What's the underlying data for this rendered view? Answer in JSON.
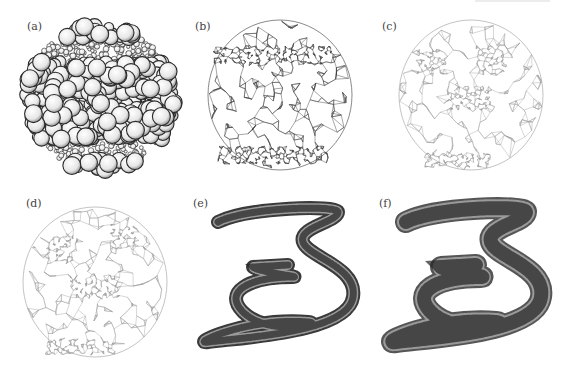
{
  "figure": {
    "panels": [
      {
        "id": "a",
        "label": "(a)",
        "description": "sphere packing"
      },
      {
        "id": "b",
        "label": "(b)",
        "description": "triangulated sphere mesh"
      },
      {
        "id": "c",
        "label": "(c)",
        "description": "triangulated irregular mesh"
      },
      {
        "id": "d",
        "label": "(d)",
        "description": "triangulated irregular mesh"
      },
      {
        "id": "e",
        "label": "(e)",
        "description": "spiral tube point cloud"
      },
      {
        "id": "f",
        "label": "(f)",
        "description": "spiral tube triangulated mesh"
      }
    ]
  },
  "colors": {
    "background": "#ffffff",
    "label": "#444444",
    "mesh_dark": "#333333",
    "mesh_light": "#9a9a9a",
    "sphere_fill": "#f2f2f2",
    "sphere_stroke": "#2a2a2a"
  }
}
